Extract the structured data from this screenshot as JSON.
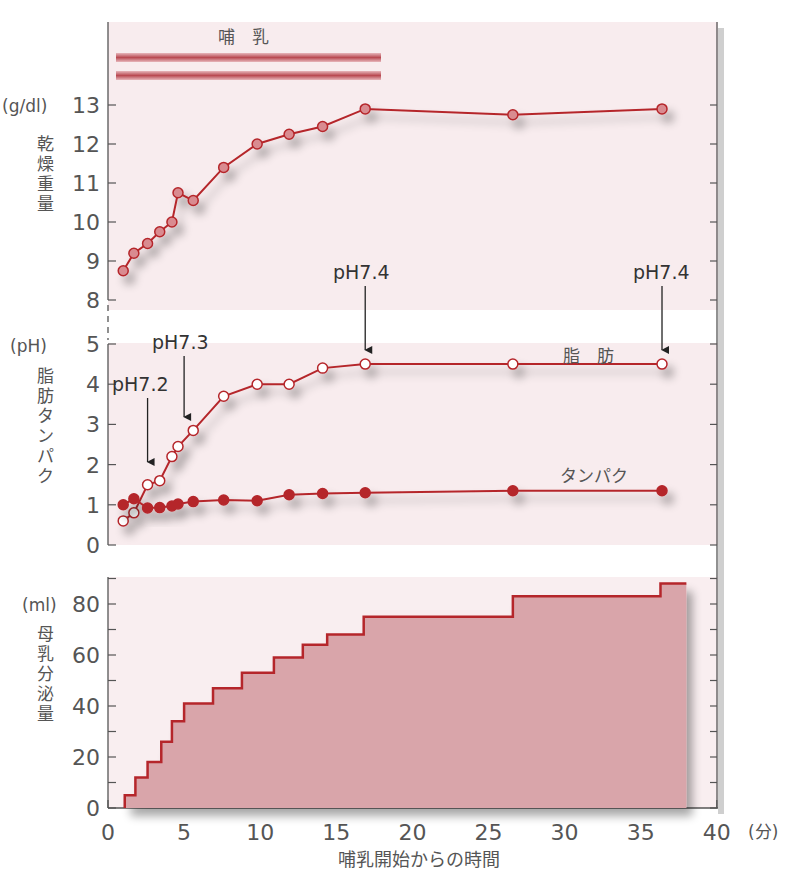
{
  "chart_data": [
    {
      "type": "line",
      "title": "乾燥重量",
      "ylabel": "乾燥重量",
      "yunit": "(g/dl)",
      "ylim": [
        8,
        13
      ],
      "yticks": [
        8,
        9,
        10,
        11,
        12,
        13
      ],
      "annotation_bar": "哺　乳",
      "annotation_bar_x": [
        0.5,
        17.5
      ],
      "series": [
        {
          "name": "乾燥重量",
          "x": [
            1,
            1.7,
            2.6,
            3.4,
            4.2,
            4.6,
            5.6,
            7.6,
            9.8,
            11.9,
            14.1,
            16.9,
            26.6,
            36.4
          ],
          "values": [
            8.75,
            9.2,
            9.45,
            9.75,
            10.0,
            10.75,
            10.55,
            11.4,
            12.0,
            12.25,
            12.45,
            12.9,
            12.75,
            12.9
          ]
        }
      ]
    },
    {
      "type": "line",
      "title": "脂肪・タンパク",
      "ylabel": "脂肪タンパク",
      "yunit": "(pH)",
      "ylim": [
        0,
        5
      ],
      "yticks": [
        0,
        1,
        2,
        3,
        4,
        5
      ],
      "series": [
        {
          "name": "脂肪",
          "marker": "open-circle",
          "x": [
            1,
            1.7,
            2.6,
            3.4,
            4.2,
            4.6,
            5.6,
            7.6,
            9.8,
            11.9,
            14.1,
            16.9,
            26.6,
            36.4
          ],
          "values": [
            0.6,
            0.8,
            1.5,
            1.6,
            2.2,
            2.45,
            2.85,
            3.7,
            4.0,
            4.0,
            4.4,
            4.5,
            4.5,
            4.5
          ]
        },
        {
          "name": "タンパク",
          "marker": "filled-circle",
          "x": [
            1,
            1.7,
            2.6,
            3.4,
            4.2,
            4.6,
            5.6,
            7.6,
            9.8,
            11.9,
            14.1,
            16.9,
            26.6,
            36.4
          ],
          "values": [
            1.0,
            1.15,
            0.92,
            0.93,
            0.97,
            1.02,
            1.08,
            1.12,
            1.1,
            1.25,
            1.28,
            1.3,
            1.35,
            1.35
          ]
        }
      ],
      "annotations": [
        {
          "text": "pH7.2",
          "x": 2.6
        },
        {
          "text": "pH7.3",
          "x": 5.0
        },
        {
          "text": "pH7.4",
          "x": 16.9
        },
        {
          "text": "pH7.4",
          "x": 36.4
        }
      ]
    },
    {
      "type": "area",
      "title": "母乳分泌量",
      "ylabel": "母乳分泌量",
      "yunit": "(ml)",
      "ylim": [
        0,
        90
      ],
      "yticks": [
        0,
        20,
        40,
        60,
        80
      ],
      "xlabel": "哺乳開始からの時間",
      "xunit": "(分)",
      "xlim": [
        0,
        40
      ],
      "xticks": [
        0,
        5,
        10,
        15,
        20,
        25,
        30,
        35,
        40
      ],
      "series": [
        {
          "name": "母乳分泌量",
          "step": true,
          "x": [
            1.1,
            1.8,
            2.6,
            3.5,
            4.2,
            5.0,
            6.9,
            8.8,
            10.9,
            12.8,
            14.4,
            16.8,
            26.6,
            36.3,
            38
          ],
          "values": [
            5,
            12,
            18,
            26,
            34,
            41,
            47,
            53,
            59,
            64,
            68,
            75,
            83,
            88,
            88
          ]
        }
      ]
    }
  ],
  "labels": {
    "top_unit": "(g/dl)",
    "top_ylabel": [
      "乾",
      "燥",
      "重",
      "量"
    ],
    "mid_unit": "(pH)",
    "mid_ylabel": [
      "脂",
      "肪",
      "タ",
      "ン",
      "パ",
      "ク"
    ],
    "bot_unit": "(ml)",
    "bot_ylabel": [
      "母",
      "乳",
      "分",
      "泌",
      "量"
    ],
    "nursing": "哺　乳",
    "fat": "脂　肪",
    "protein": "タンパク",
    "xlabel": "哺乳開始からの時間",
    "xunit": "(分)"
  },
  "colors": {
    "line": "#b5262b",
    "panel_bg": "#f7e9ec",
    "area_fill": "#d9a5aa",
    "marker_fill_top": "#d98b90",
    "axis": "#555555"
  }
}
